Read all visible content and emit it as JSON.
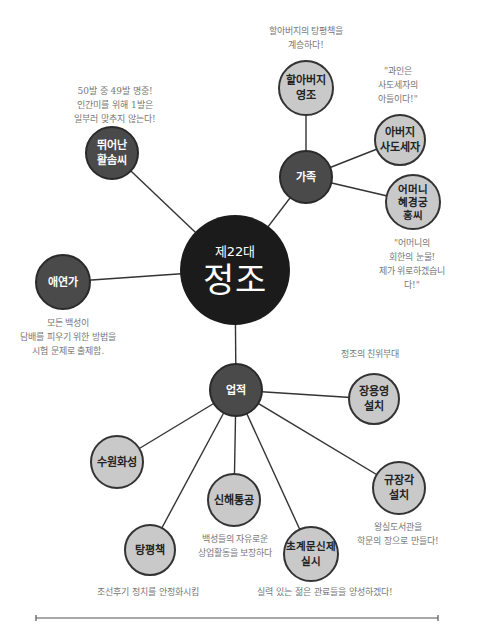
{
  "center": {
    "subtitle": "제22대",
    "title": "정조"
  },
  "colors": {
    "center": "#1b1b1b",
    "category": "#4a4a4a",
    "leaf": "#c9c9c9",
    "line": "#333333",
    "note_text": "#777777"
  },
  "nodes": {
    "family": {
      "label": "가족"
    },
    "grandfather": {
      "label": "할아버지\n영조",
      "note": "할아버지의 탕평책을\n계승하다!"
    },
    "father": {
      "label": "아버지\n사도세자",
      "note": "\"과인은\n사도세자의\n아들이다!\""
    },
    "mother": {
      "label": "어머니\n혜경궁\n홍씨",
      "note": "\"어머니의\n회한의 눈물!\n제가 위로하겠습니다!\""
    },
    "archery": {
      "label": "뛰어난\n활솜씨",
      "note": "50발 중 49발 명중!\n인간미를 위해 1발은\n일부러 맞추지 않는다!"
    },
    "smoker": {
      "label": "애연가",
      "note": "모든 백성이\n담배를 피우기 위한 방법을\n시험 문제로 출제함."
    },
    "achievements": {
      "label": "업적"
    },
    "jangyongyeong": {
      "label": "장용영\n설치",
      "note": "정조의 친위부대"
    },
    "suwon": {
      "label": "수원화성"
    },
    "sinhae": {
      "label": "신해통공",
      "note": "백성들의 자유로운\n상업활동을 보장하다"
    },
    "kyujanggak": {
      "label": "규장각\n설치",
      "note": "왕실도서관을\n학문의 장으로 만들다!"
    },
    "tangpyeong": {
      "label": "탕평책",
      "note": "조선후기 정치를 안정화시킴"
    },
    "chogye": {
      "label": "초계문신제\n실시",
      "note": "실력 있는 젊은 관료들을 양성하겠다!"
    }
  }
}
